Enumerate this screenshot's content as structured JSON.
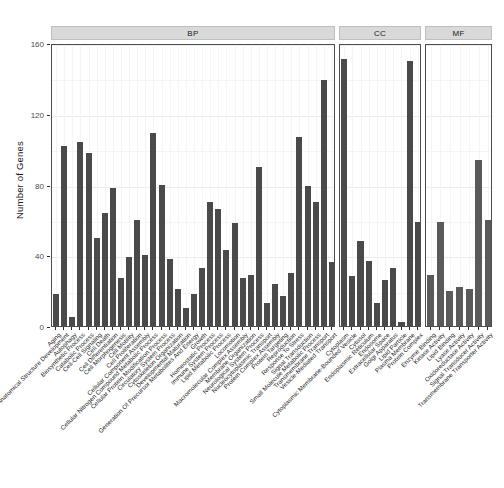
{
  "chart_data": {
    "type": "bar",
    "title": "",
    "subtitle": "",
    "xlabel": "",
    "ylabel": "Number of Genes",
    "ylim": [
      0,
      160
    ],
    "yticks": [
      0,
      40,
      80,
      120,
      160
    ],
    "ytick_labels": [
      "0",
      "40",
      "80",
      "120",
      "160"
    ],
    "grid": true,
    "grid_axis": "y",
    "legend": "none",
    "bar_color": "#4a4a4a",
    "panel_header_bg": "#d9d9d9",
    "panel_border": "#4d4d4d",
    "facets": [
      {
        "name": "BP",
        "label": "BP",
        "bar_color": "#4a4a4a",
        "categories": [
          "Aging",
          "Anatomical Structure Development",
          "Autophagy",
          "Biosynthetic Process",
          "Catabolic Process",
          "Cell-Cell Signaling",
          "Cell Death",
          "Cell Differentiation",
          "Cell Morphogenesis",
          "Cell Motility",
          "Cell Proliferation",
          "Cellular Component Assembly",
          "Cellular Nitrogen Compound Metabolic Process",
          "Cellular Protein Modification Process",
          "Circulatory System Process",
          "Cytoskeleton Organization",
          "Developmental Maturation",
          "Generation Of Precursor Metabolites And Energy",
          "Growth",
          "Homeostatic Process",
          "Immune System Process",
          "Lipid Metabolic Process",
          "Locomotion",
          "Macromolecular Complex Assembly",
          "Membrane Organization",
          "Neurological System Process",
          "Nucleocytoplasmic Transport",
          "Protein Complex Assembly",
          "Protein Targeting",
          "Reproduction",
          "Response To Stress",
          "Signal Transduction",
          "Small Molecule Metabolic Process",
          "Transmembrane Transport",
          "Vesicle-Mediated Transport"
        ],
        "values": [
          18,
          102,
          5,
          104,
          98,
          50,
          64,
          78,
          27,
          39,
          60,
          40,
          109,
          80,
          38,
          21,
          10,
          18,
          33,
          70,
          66,
          43,
          58,
          27,
          29,
          90,
          13,
          24,
          17,
          30,
          107,
          79,
          70,
          139,
          36
        ]
      },
      {
        "name": "CC",
        "label": "CC",
        "bar_color": "#4a4a4a",
        "categories": [
          "Cytoplasm",
          "Cytoplasmic Membrane-Bounded Vesicle",
          "Cytosol",
          "Endoplasmic Reticulum",
          "Endosome",
          "Extracellular Space",
          "Golgi Apparatus",
          "Lipid Particle",
          "Plasma Membrane",
          "Protein Complex"
        ],
        "values": [
          151,
          28,
          48,
          37,
          13,
          26,
          33,
          2,
          150,
          59
        ]
      },
      {
        "name": "MF",
        "label": "MF",
        "bar_color": "#5a5a5a",
        "categories": [
          "Enzyme Binding",
          "Kinase Activity",
          "Lipid Binding",
          "Lyase Activity",
          "Oxidoreductase Activity",
          "Signal Transducer Activity",
          "Transmembrane Transporter Activity"
        ],
        "values": [
          29,
          59,
          20,
          22,
          21,
          94,
          60
        ]
      }
    ]
  }
}
